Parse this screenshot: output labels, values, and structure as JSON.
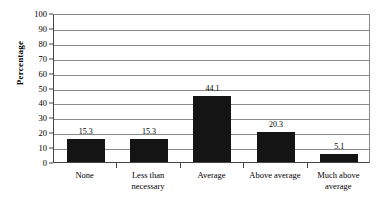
{
  "chart_data": {
    "type": "bar",
    "title": "",
    "subtitle": "",
    "xlabel": "",
    "ylabel": "Percentage",
    "ylim": [
      0,
      100
    ],
    "ytick_step": 10,
    "yticks": [
      100,
      90,
      80,
      70,
      60,
      50,
      40,
      30,
      20,
      10,
      0
    ],
    "grid": true,
    "legend": false,
    "legend_position": "none",
    "categories": [
      "None",
      "Less than necessary",
      "Average",
      "Above average",
      "Much above average"
    ],
    "category_lines": [
      [
        "None"
      ],
      [
        "Less than",
        "necessary"
      ],
      [
        "Average"
      ],
      [
        "Above average"
      ],
      [
        "Much above",
        "average"
      ]
    ],
    "values": [
      15.3,
      15.3,
      44.1,
      20.3,
      5.1
    ],
    "value_labels": [
      "15.3",
      "15.3",
      "44.1",
      "20.3",
      "5.1"
    ]
  },
  "style": {
    "bar_color": "#141414",
    "gridline_color": "#8a8a8a",
    "axis_color": "#444444",
    "background": "#ffffff",
    "text_color": "#000000"
  }
}
